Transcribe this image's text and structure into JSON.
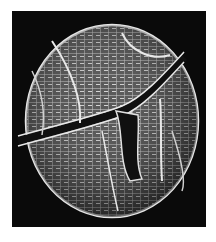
{
  "image": {
    "subject": "SEM micrograph of a reticulate cyst / pollen grain",
    "background_color": "#0a0a0a",
    "page_background": "#ffffff",
    "specimen_color": "#d8d8d8"
  }
}
